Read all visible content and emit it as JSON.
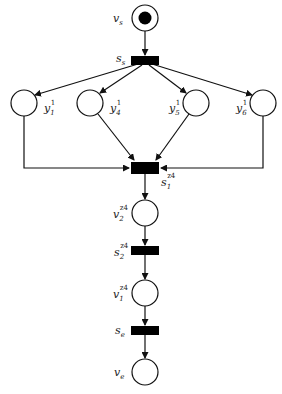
{
  "diagram": {
    "type": "petri-net",
    "colors": {
      "stroke": "#111111",
      "fill_transition": "#000000",
      "background": "#ffffff"
    },
    "places": [
      {
        "id": "vs",
        "label": "v",
        "sub": "s",
        "sup": "",
        "cx": 145,
        "cy": 18,
        "token": true
      },
      {
        "id": "y1",
        "label": "y",
        "sub": "1",
        "sup": "1",
        "cx": 24,
        "cy": 103,
        "token": false
      },
      {
        "id": "y4",
        "label": "y",
        "sub": "4",
        "sup": "1",
        "cx": 90,
        "cy": 103,
        "token": false
      },
      {
        "id": "y5",
        "label": "y",
        "sub": "5",
        "sup": "1",
        "cx": 196,
        "cy": 103,
        "token": false
      },
      {
        "id": "y6",
        "label": "y",
        "sub": "6",
        "sup": "1",
        "cx": 263,
        "cy": 103,
        "token": false
      },
      {
        "id": "v2",
        "label": "v",
        "sub": "2",
        "sup": "z4",
        "cx": 145,
        "cy": 213,
        "token": false
      },
      {
        "id": "v1",
        "label": "v",
        "sub": "1",
        "sup": "z4",
        "cx": 145,
        "cy": 293,
        "token": false
      },
      {
        "id": "ve",
        "label": "v",
        "sub": "e",
        "sup": "",
        "cx": 145,
        "cy": 372,
        "token": false
      }
    ],
    "transitions": [
      {
        "id": "ss",
        "label": "s",
        "sub": "s",
        "sup": ""
      },
      {
        "id": "s1",
        "label": "s",
        "sub": "1",
        "sup": "z4"
      },
      {
        "id": "s2",
        "label": "s",
        "sub": "2",
        "sup": "z4"
      },
      {
        "id": "se",
        "label": "s",
        "sub": "e",
        "sup": ""
      }
    ],
    "arcs": [
      [
        "vs",
        "ss"
      ],
      [
        "ss",
        "y1"
      ],
      [
        "ss",
        "y4"
      ],
      [
        "ss",
        "y5"
      ],
      [
        "ss",
        "y6"
      ],
      [
        "y1",
        "s1"
      ],
      [
        "y4",
        "s1"
      ],
      [
        "y5",
        "s1"
      ],
      [
        "y6",
        "s1"
      ],
      [
        "s1",
        "v2"
      ],
      [
        "v2",
        "s2"
      ],
      [
        "s2",
        "v1"
      ],
      [
        "v1",
        "se"
      ],
      [
        "se",
        "ve"
      ]
    ]
  }
}
